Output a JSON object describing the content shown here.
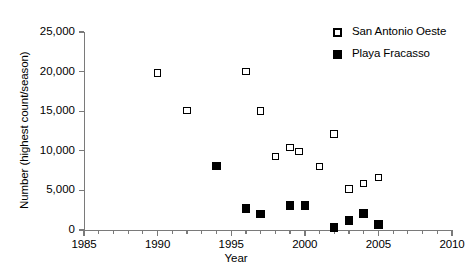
{
  "chart_data": {
    "type": "scatter",
    "title": "",
    "xlabel": "Year",
    "ylabel": "Number (highest count/season)",
    "xlim": [
      1985,
      2010
    ],
    "ylim": [
      0,
      25000
    ],
    "grid": false,
    "legend_position": "top-right",
    "x_ticks": [
      1985,
      1990,
      1995,
      2000,
      2005,
      2010
    ],
    "x_tick_labels": [
      "1985",
      "1990",
      "1995",
      "2000",
      "2005",
      "2010"
    ],
    "x_minor_tick_step": 1,
    "y_ticks": [
      0,
      5000,
      10000,
      15000,
      20000,
      25000
    ],
    "y_tick_labels": [
      "0",
      "5,000",
      "10,000",
      "15,000",
      "20,000",
      "25,000"
    ],
    "series": [
      {
        "name": "San Antonio Oeste",
        "marker": "open-square",
        "color": "#000000",
        "points": [
          {
            "x": 1990,
            "y": 19800
          },
          {
            "x": 1992,
            "y": 15100
          },
          {
            "x": 1996,
            "y": 20000
          },
          {
            "x": 1997,
            "y": 15000
          },
          {
            "x": 1998,
            "y": 9300
          },
          {
            "x": 1999,
            "y": 10400
          },
          {
            "x": 1999.6,
            "y": 9900
          },
          {
            "x": 2001,
            "y": 8000
          },
          {
            "x": 2002,
            "y": 12100
          },
          {
            "x": 2003,
            "y": 5200
          },
          {
            "x": 2004,
            "y": 5900
          },
          {
            "x": 2005,
            "y": 6600
          }
        ]
      },
      {
        "name": "Playa Fracasso",
        "marker": "filled-square",
        "color": "#000000",
        "points": [
          {
            "x": 1994,
            "y": 8100
          },
          {
            "x": 1996,
            "y": 2700
          },
          {
            "x": 1997,
            "y": 2000
          },
          {
            "x": 1999,
            "y": 3100
          },
          {
            "x": 2000,
            "y": 3100
          },
          {
            "x": 2002,
            "y": 300
          },
          {
            "x": 2003,
            "y": 1200
          },
          {
            "x": 2004,
            "y": 2100
          },
          {
            "x": 2005,
            "y": 700
          }
        ]
      }
    ]
  },
  "legend": {
    "entries": [
      {
        "label": "San Antonio Oeste",
        "marker": "open-square"
      },
      {
        "label": "Playa Fracasso",
        "marker": "filled-square"
      }
    ]
  }
}
